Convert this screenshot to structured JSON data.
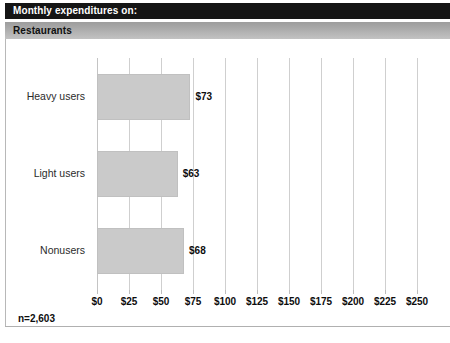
{
  "header": {
    "title": "Monthly expenditures on:",
    "subtitle": "Restaurants",
    "title_bg": "#151515",
    "title_color": "#ffffff",
    "subtitle_bg": "#a9a9a9",
    "subtitle_color": "#101010"
  },
  "footnote": "n=2,603",
  "chart_data": {
    "type": "bar",
    "orientation": "horizontal",
    "title": "Monthly expenditures on:",
    "subtitle": "Restaurants",
    "categories": [
      "Heavy users",
      "Light users",
      "Nonusers"
    ],
    "values": [
      73,
      63,
      68
    ],
    "value_labels": [
      "$73",
      "$63",
      "$68"
    ],
    "xlabel": "",
    "ylabel": "",
    "xlim": [
      0,
      250
    ],
    "xticks": [
      0,
      25,
      50,
      75,
      100,
      125,
      150,
      175,
      200,
      225,
      250
    ],
    "xtick_labels": [
      "$0",
      "$25",
      "$50",
      "$75",
      "$100",
      "$125",
      "$150",
      "$175",
      "$200",
      "$225",
      "$250"
    ],
    "grid": true,
    "grid_axis": "x",
    "legend": false,
    "bar_color": "#cacaca",
    "grid_color": "#cfcfcf",
    "annotation": "n=2,603"
  }
}
